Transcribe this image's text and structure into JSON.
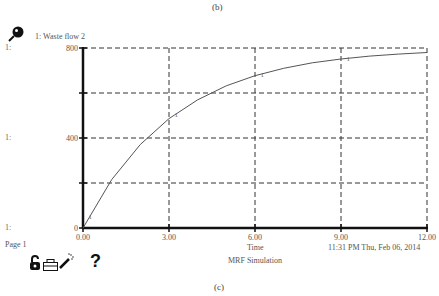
{
  "figure": {
    "caption_top": "(b)",
    "caption_bottom": "(c)"
  },
  "legend": {
    "icon": "pin-icon",
    "label": "1: Waste flow 2"
  },
  "row_labels": [
    "1:",
    "1:",
    "1:"
  ],
  "footer": {
    "page": "Page 1",
    "axis_title": "Time",
    "timestamp": "11:31 PM  Thu, Feb 06, 2014",
    "model_name": "MRF Simulation"
  },
  "toolbar": {
    "lock_icon": "unlock-icon",
    "print_icon": "printer-icon",
    "wand_icon": "magic-wand-icon",
    "help_label": "?"
  },
  "colors": {
    "axis": "#111111",
    "grid": "#333333",
    "series": "#555555"
  },
  "chart_data": {
    "type": "line",
    "title": "1: Waste flow 2",
    "xlabel": "Time",
    "ylabel": "",
    "xlim": [
      0,
      12
    ],
    "ylim": [
      0,
      800
    ],
    "x_ticks": [
      "0.00",
      "3.00",
      "6.00",
      "9.00",
      "12.00"
    ],
    "y_ticks": [
      "0",
      "400",
      "800"
    ],
    "grid": true,
    "grid_style": "dashed",
    "legend_position": "top-left",
    "series": [
      {
        "name": "Waste flow 2",
        "marker_label": "1",
        "x": [
          0,
          1,
          2,
          3,
          4,
          5,
          6,
          7,
          8,
          9,
          10,
          11,
          12
        ],
        "values": [
          0,
          215,
          371,
          486,
          570,
          632,
          677,
          710,
          734,
          751,
          764,
          773,
          780
        ]
      }
    ]
  }
}
